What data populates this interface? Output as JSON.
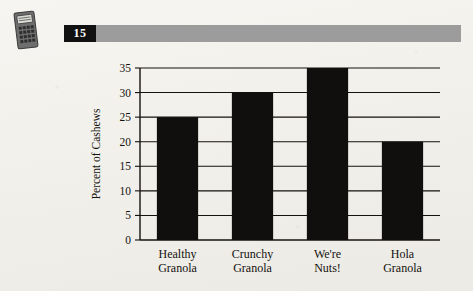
{
  "page": {
    "background_color": "#f3f2ed",
    "ink_color": "#14120f"
  },
  "icon": {
    "name": "calculator-icon",
    "label": "calculator"
  },
  "header": {
    "number": "15",
    "number_box_color": "#111111",
    "number_text_color": "#ffffff",
    "bar_color": "#9c9c9c"
  },
  "chart_data": {
    "type": "bar",
    "title": "",
    "xlabel": "",
    "ylabel": "Percent of Cashews",
    "categories": [
      "Healthy Granola",
      "Crunchy Granola",
      "We're Nuts!",
      "Hola Granola"
    ],
    "category_lines": [
      [
        "Healthy",
        "Granola"
      ],
      [
        "Crunchy",
        "Granola"
      ],
      [
        "We're",
        "Nuts!"
      ],
      [
        "Hola",
        "Granola"
      ]
    ],
    "values": [
      25,
      30,
      35,
      20
    ],
    "ylim": [
      0,
      35
    ],
    "ytick_step": 5,
    "yticks": [
      0,
      5,
      10,
      15,
      20,
      25,
      30,
      35
    ],
    "ytick_labels": [
      "0",
      "5",
      "10",
      "15",
      "20",
      "25",
      "30",
      "35"
    ],
    "grid": true,
    "legend": null,
    "bar_color": "#100f0d"
  }
}
